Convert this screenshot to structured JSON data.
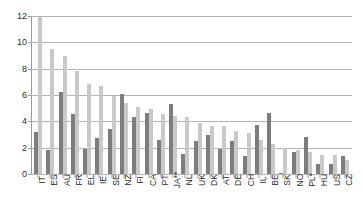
{
  "chart_data": {
    "type": "bar",
    "title": "",
    "subtitle": "",
    "xlabel": "",
    "ylabel": "",
    "ylim": [
      0,
      12
    ],
    "yticks": [
      0,
      2,
      4,
      6,
      8,
      10,
      12
    ],
    "grid": true,
    "legend": "none",
    "orientation": "vertical",
    "grouping": "grouped",
    "categories": [
      "IT",
      "ES",
      "AU",
      "FR",
      "EL",
      "IE",
      "SE",
      "NZ",
      "FI",
      "CA",
      "PT",
      "JA**",
      "NL",
      "UK",
      "DK",
      "AT",
      "DE",
      "CH",
      "IL",
      "BE",
      "SK",
      "NO",
      "PL*",
      "HU",
      "US",
      "CZ"
    ],
    "series": [
      {
        "name": "series-1",
        "color": "#7d7d7d",
        "values": [
          3.2,
          1.85,
          6.25,
          4.55,
          1.9,
          2.7,
          3.4,
          6.1,
          4.3,
          4.65,
          2.55,
          5.35,
          1.55,
          2.5,
          2.95,
          1.9,
          2.5,
          1.4,
          3.75,
          4.6,
          0.1,
          1.7,
          2.8,
          0.75,
          0.75,
          1.35
        ]
      },
      {
        "name": "series-2",
        "color": "#c9c9c9",
        "values": [
          11.9,
          9.5,
          9.0,
          7.8,
          6.85,
          6.65,
          5.95,
          5.4,
          5.1,
          4.95,
          4.55,
          4.4,
          4.3,
          3.9,
          3.65,
          3.65,
          3.25,
          3.1,
          2.6,
          2.25,
          2.0,
          1.8,
          1.65,
          1.45,
          1.45,
          1.05
        ]
      }
    ],
    "colors": {
      "series1": "#7d7d7d",
      "series2": "#c9c9c9",
      "gridline": "#b4b4b4",
      "axis": "#9a9a9a",
      "text": "#2b2b2b",
      "background": "#ffffff"
    }
  }
}
